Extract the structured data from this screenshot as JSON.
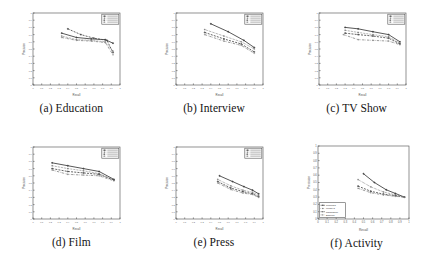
{
  "figure": {
    "name": "precision-recall-curves-grid",
    "rows": 2,
    "cols": 3
  },
  "axes": {
    "xlabel": "Recall",
    "ylabel": "Precision",
    "xticks": [
      "0",
      "0.1",
      "0.2",
      "0.3",
      "0.4",
      "0.5",
      "0.6",
      "0.7",
      "0.8",
      "0.9",
      "1"
    ],
    "yticks": [
      "0",
      "0.1",
      "0.2",
      "0.3",
      "0.4",
      "0.5",
      "0.6",
      "0.7",
      "0.8",
      "0.9",
      "1"
    ],
    "xlim": [
      0,
      1
    ],
    "ylim": [
      0,
      1
    ]
  },
  "legend": {
    "position": "upper-right",
    "entries": [
      {
        "label": "Proposed",
        "color": "#3a3a3a",
        "marker": "cross",
        "dash": "none"
      },
      {
        "label": "MedRI-3",
        "color": "#6a6a6a",
        "marker": "plus",
        "dash": "dotted"
      },
      {
        "label": "Ngram2016",
        "color": "#4a4a4a",
        "marker": "cross",
        "dash": "dashed"
      },
      {
        "label": "Baseline",
        "color": "#8a8a8a",
        "marker": "plus",
        "dash": "dashdot"
      }
    ]
  },
  "chart_data": [
    {
      "type": "line",
      "panel": "a",
      "title": "(a) Education",
      "xlabel": "Recall",
      "ylabel": "Precision",
      "xlim": [
        0,
        1
      ],
      "ylim": [
        0,
        1
      ],
      "grid": false,
      "legend_position": "upper-right",
      "series": [
        {
          "name": "Proposed",
          "x": [
            0.33,
            0.5,
            0.67,
            0.83,
            0.92
          ],
          "y": [
            0.72,
            0.66,
            0.64,
            0.63,
            0.58
          ]
        },
        {
          "name": "MedRI-3",
          "x": [
            0.33,
            0.5,
            0.67,
            0.83,
            0.92
          ],
          "y": [
            0.68,
            0.63,
            0.62,
            0.6,
            0.47
          ]
        },
        {
          "name": "Ngram2016",
          "x": [
            0.4,
            0.55,
            0.7,
            0.85,
            0.92
          ],
          "y": [
            0.78,
            0.7,
            0.65,
            0.62,
            0.45
          ]
        },
        {
          "name": "Baseline",
          "x": [
            0.33,
            0.5,
            0.67,
            0.83,
            0.92
          ],
          "y": [
            0.66,
            0.62,
            0.61,
            0.59,
            0.42
          ]
        }
      ]
    },
    {
      "type": "line",
      "panel": "b",
      "title": "(b) Interview",
      "xlabel": "Recall",
      "ylabel": "Precision",
      "xlim": [
        0,
        1
      ],
      "ylim": [
        0,
        1
      ],
      "grid": false,
      "legend_position": "upper-right",
      "series": [
        {
          "name": "Proposed",
          "x": [
            0.4,
            0.6,
            0.78,
            0.9
          ],
          "y": [
            0.85,
            0.74,
            0.62,
            0.52
          ]
        },
        {
          "name": "MedRI-3",
          "x": [
            0.33,
            0.55,
            0.75,
            0.9
          ],
          "y": [
            0.77,
            0.68,
            0.6,
            0.5
          ]
        },
        {
          "name": "Ngram2016",
          "x": [
            0.33,
            0.55,
            0.75,
            0.9
          ],
          "y": [
            0.73,
            0.64,
            0.57,
            0.46
          ]
        },
        {
          "name": "Baseline",
          "x": [
            0.33,
            0.55,
            0.75,
            0.9
          ],
          "y": [
            0.7,
            0.61,
            0.55,
            0.44
          ]
        }
      ]
    },
    {
      "type": "line",
      "panel": "c",
      "title": "(c) TV Show",
      "xlabel": "Recall",
      "ylabel": "Precision",
      "xlim": [
        0,
        1
      ],
      "ylim": [
        0,
        1
      ],
      "grid": false,
      "legend_position": "upper-right",
      "series": [
        {
          "name": "Proposed",
          "x": [
            0.3,
            0.45,
            0.62,
            0.8,
            0.93
          ],
          "y": [
            0.8,
            0.78,
            0.74,
            0.7,
            0.6
          ]
        },
        {
          "name": "MedRI-3",
          "x": [
            0.3,
            0.45,
            0.62,
            0.8,
            0.93
          ],
          "y": [
            0.76,
            0.73,
            0.7,
            0.67,
            0.58
          ]
        },
        {
          "name": "Ngram2016",
          "x": [
            0.3,
            0.45,
            0.62,
            0.8,
            0.93
          ],
          "y": [
            0.72,
            0.7,
            0.68,
            0.65,
            0.57
          ]
        },
        {
          "name": "Baseline",
          "x": [
            0.28,
            0.45,
            0.62,
            0.8,
            0.93
          ],
          "y": [
            0.7,
            0.63,
            0.62,
            0.61,
            0.56
          ]
        }
      ]
    },
    {
      "type": "line",
      "panel": "d",
      "title": "(d) Film",
      "xlabel": "Recall",
      "ylabel": "Precision",
      "xlim": [
        0,
        1
      ],
      "ylim": [
        0,
        1
      ],
      "grid": false,
      "legend_position": "upper-right",
      "series": [
        {
          "name": "Proposed",
          "x": [
            0.22,
            0.4,
            0.58,
            0.76,
            0.93
          ],
          "y": [
            0.78,
            0.74,
            0.7,
            0.66,
            0.55
          ]
        },
        {
          "name": "MedRI-3",
          "x": [
            0.22,
            0.4,
            0.58,
            0.76,
            0.93
          ],
          "y": [
            0.74,
            0.7,
            0.67,
            0.63,
            0.54
          ]
        },
        {
          "name": "Ngram2016",
          "x": [
            0.22,
            0.4,
            0.58,
            0.76,
            0.93
          ],
          "y": [
            0.7,
            0.66,
            0.64,
            0.62,
            0.54
          ]
        },
        {
          "name": "Baseline",
          "x": [
            0.22,
            0.4,
            0.58,
            0.76,
            0.93
          ],
          "y": [
            0.68,
            0.62,
            0.61,
            0.6,
            0.53
          ]
        }
      ]
    },
    {
      "type": "line",
      "panel": "e",
      "title": "(e) Press",
      "xlabel": "Recall",
      "ylabel": "Precision",
      "xlim": [
        0,
        1
      ],
      "ylim": [
        0,
        1
      ],
      "grid": false,
      "legend_position": "upper-right",
      "series": [
        {
          "name": "Proposed",
          "x": [
            0.5,
            0.65,
            0.78,
            0.88,
            0.95
          ],
          "y": [
            0.6,
            0.52,
            0.45,
            0.4,
            0.35
          ]
        },
        {
          "name": "MedRI-3",
          "x": [
            0.48,
            0.63,
            0.77,
            0.88,
            0.95
          ],
          "y": [
            0.55,
            0.46,
            0.4,
            0.37,
            0.33
          ]
        },
        {
          "name": "Ngram2016",
          "x": [
            0.48,
            0.63,
            0.77,
            0.88,
            0.95
          ],
          "y": [
            0.52,
            0.43,
            0.38,
            0.35,
            0.31
          ]
        },
        {
          "name": "Baseline",
          "x": [
            0.48,
            0.63,
            0.77,
            0.88,
            0.95
          ],
          "y": [
            0.5,
            0.41,
            0.36,
            0.34,
            0.3
          ]
        }
      ]
    },
    {
      "type": "line",
      "panel": "f",
      "title": "(f) Activity",
      "xlabel": "Recall",
      "ylabel": "Precision",
      "xlim": [
        0,
        1
      ],
      "ylim": [
        0,
        1
      ],
      "grid": false,
      "legend_position": "lower-left",
      "series": [
        {
          "name": "Proposed",
          "x": [
            0.5,
            0.62,
            0.75,
            0.85,
            0.95
          ],
          "y": [
            0.62,
            0.5,
            0.4,
            0.35,
            0.3
          ]
        },
        {
          "name": "MedRI-3",
          "x": [
            0.44,
            0.58,
            0.72,
            0.85,
            0.95
          ],
          "y": [
            0.54,
            0.44,
            0.37,
            0.33,
            0.3
          ]
        },
        {
          "name": "Ngram2016",
          "x": [
            0.44,
            0.58,
            0.72,
            0.85,
            0.95
          ],
          "y": [
            0.45,
            0.38,
            0.34,
            0.32,
            0.3
          ]
        },
        {
          "name": "Baseline",
          "x": [
            0.44,
            0.58,
            0.72,
            0.85,
            0.95
          ],
          "y": [
            0.42,
            0.36,
            0.33,
            0.31,
            0.3
          ]
        }
      ]
    }
  ]
}
